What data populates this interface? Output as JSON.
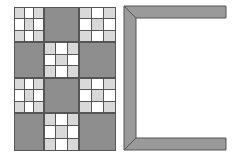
{
  "colors": {
    "dark": "#8e8e8e",
    "light": "#d9d9d9",
    "white": "#ffffff",
    "line": "#555555",
    "frame": "#9a9a9a"
  },
  "quilt": {
    "rows": 4,
    "cols": 3,
    "layout": [
      [
        "patch",
        "dark",
        "patch"
      ],
      [
        "dark",
        "patch",
        "dark"
      ],
      [
        "patch",
        "dark",
        "patch"
      ],
      [
        "dark",
        "patch",
        "dark"
      ]
    ],
    "patch_pattern": [
      [
        "light",
        "white",
        "light"
      ],
      [
        "white",
        "light",
        "white"
      ],
      [
        "light",
        "white",
        "light"
      ]
    ]
  },
  "frame": {
    "shape": "open-bracket-left",
    "thickness": 12,
    "mitered_corners": true
  }
}
